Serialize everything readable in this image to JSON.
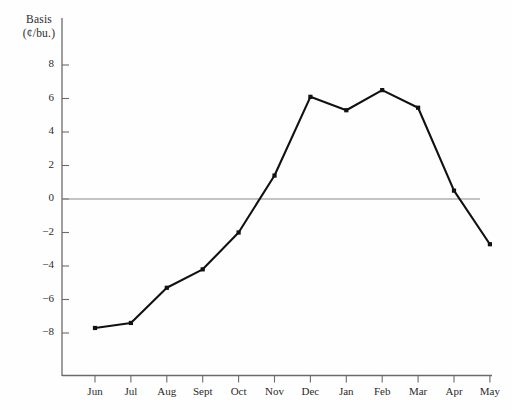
{
  "chart_data": {
    "type": "line",
    "title": "",
    "ylabel_line1": "Basis",
    "ylabel_line2": "(¢/bu.)",
    "xlabel": "",
    "categories": [
      "Jun",
      "Jul",
      "Aug",
      "Sept",
      "Oct",
      "Nov",
      "Dec",
      "Jan",
      "Feb",
      "Mar",
      "Apr",
      "May"
    ],
    "values": [
      -7.7,
      -7.4,
      -5.3,
      -4.2,
      -2.0,
      1.4,
      6.1,
      5.3,
      6.5,
      5.45,
      0.5,
      -2.7
    ],
    "ylim": [
      -9.2,
      8.6
    ],
    "yticks": [
      8,
      6,
      4,
      2,
      0,
      -2,
      -4,
      -6,
      -8
    ],
    "ytick_labels": [
      "8",
      "6",
      "4",
      "2",
      "0",
      "−2",
      "−4",
      "−6",
      "−8"
    ],
    "grid": false,
    "legend": null,
    "zero_line": 0,
    "series_color": "#111111",
    "zero_line_color": "#8a8a8a",
    "axis_color": "#6b6b6b",
    "marker": "square"
  }
}
